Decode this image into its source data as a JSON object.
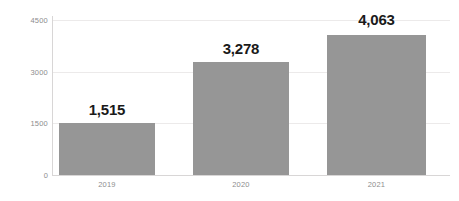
{
  "chart_data": {
    "type": "bar",
    "title": "",
    "subtitle": "",
    "xlabel": "",
    "ylabel": "",
    "categories": [
      "2019",
      "2020",
      "2021"
    ],
    "values": [
      1515,
      3278,
      4063
    ],
    "value_labels": [
      "1,515",
      "3,278",
      "4,063"
    ],
    "ylim": [
      0,
      4500
    ],
    "yticks": [
      0,
      1500,
      3000,
      4500
    ],
    "ytick_labels": [
      "0",
      "1500",
      "3000",
      "4500"
    ],
    "grid": true,
    "grid_axis": "y",
    "legend": false,
    "legend_position": "none",
    "series": [
      {
        "name": "",
        "values": [
          1515,
          3278,
          4063
        ],
        "color": "#969696"
      }
    ],
    "colors": {
      "bar": "#969696",
      "gridline": "#eceaea",
      "axis": "#d8d6d6",
      "tick_text": "#8d8d8d",
      "value_text": "#1a1a1a",
      "background": "#ffffff"
    }
  }
}
